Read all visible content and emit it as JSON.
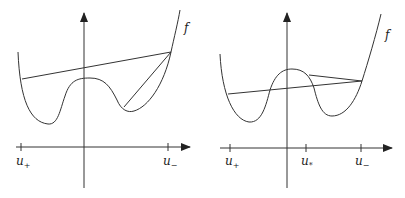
{
  "colors": {
    "stroke": "#333333",
    "background": "#ffffff"
  },
  "panels": [
    {
      "name": "left",
      "function_label": "f",
      "x_ticks": [
        {
          "label": "u",
          "sub": "+",
          "name": "u-plus"
        },
        {
          "label": "u",
          "sub": "−",
          "name": "u-minus"
        }
      ],
      "description": "Double-well f with secant from u+ to u− and chord from right well to u−"
    },
    {
      "name": "right",
      "function_label": "f",
      "x_ticks": [
        {
          "label": "u",
          "sub": "+",
          "name": "u-plus"
        },
        {
          "label": "u",
          "sub": "*",
          "name": "u-star"
        },
        {
          "label": "u",
          "sub": "−",
          "name": "u-minus"
        }
      ],
      "description": "Double-well f with secant from u+ to u− and chord from hump to u−"
    }
  ]
}
